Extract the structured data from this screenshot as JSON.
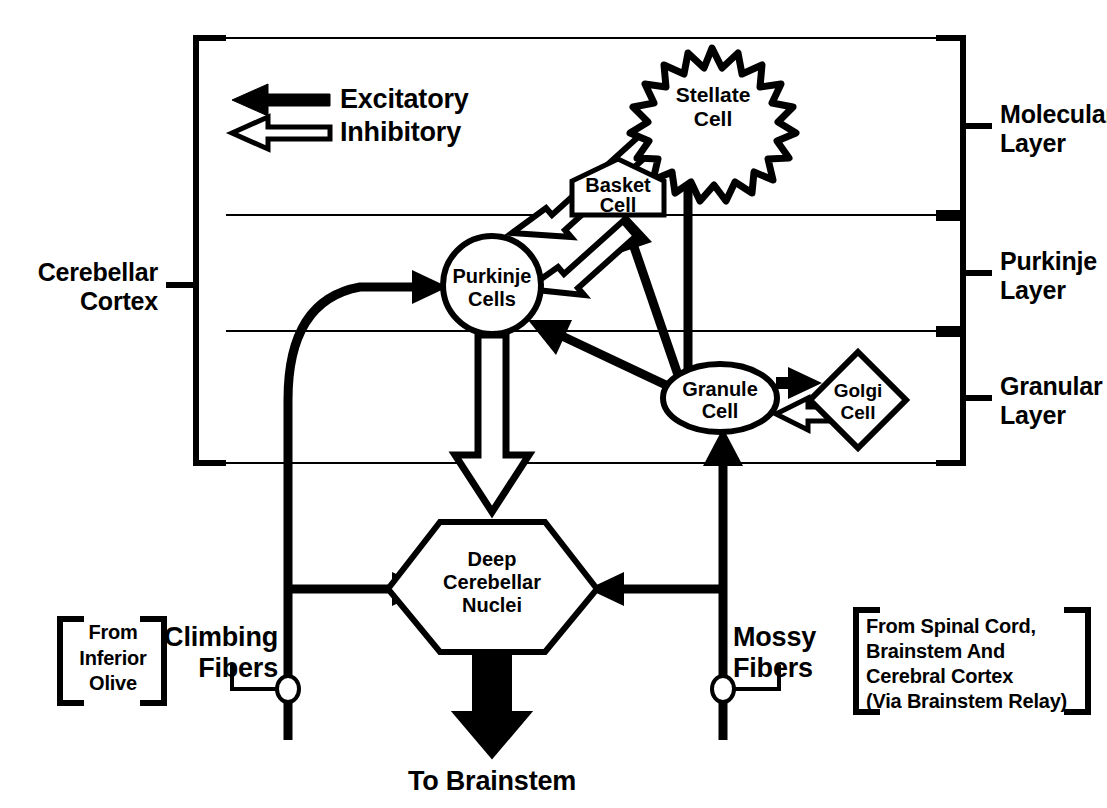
{
  "diagram": {
    "legend": {
      "excitatory_label": "Excitatory",
      "inhibitory_label": "Inhibitory"
    },
    "brackets": {
      "cerebellar_cortex": "Cerebellar\nCortex",
      "molecular_layer": "Molecular\nLayer",
      "purkinje_layer": "Purkinje\nLayer",
      "granular_layer": "Granular\nLayer"
    },
    "nodes": {
      "stellate": {
        "line1": "Stellate",
        "line2": "Cell",
        "shape": "starburst"
      },
      "basket": {
        "line1": "Basket",
        "line2": "Cell",
        "shape": "pentagon"
      },
      "purkinje": {
        "line1": "Purkinje",
        "line2": "Cells",
        "shape": "circle"
      },
      "granule": {
        "line1": "Granule",
        "line2": "Cell",
        "shape": "ellipse"
      },
      "golgi": {
        "line1": "Golgi",
        "line2": "Cell",
        "shape": "diamond"
      },
      "deep_nuclei": {
        "line1": "Deep",
        "line2": "Cerebellar",
        "line3": "Nuclei",
        "shape": "hexagon"
      }
    },
    "inputs": {
      "climbing_fibers_label": "Climbing\nFibers",
      "climbing_source": "From\nInferior\nOlive",
      "mossy_fibers_label": "Mossy\nFibers",
      "mossy_source_lines": [
        "From Spinal Cord,",
        "Brainstem And",
        "Cerebral Cortex",
        "(Via Brainstem Relay)"
      ]
    },
    "output": {
      "to_brainstem_label": "To Brainstem"
    },
    "colors": {
      "ink": "#000000",
      "background": "#ffffff"
    },
    "connections": [
      {
        "from": "stellate",
        "to": "purkinje",
        "type": "inhibitory"
      },
      {
        "from": "basket",
        "to": "purkinje",
        "type": "inhibitory"
      },
      {
        "from": "purkinje",
        "to": "deep_nuclei",
        "type": "inhibitory"
      },
      {
        "from": "golgi",
        "to": "granule",
        "type": "inhibitory"
      },
      {
        "from": "granule",
        "to": "golgi",
        "type": "excitatory"
      },
      {
        "from": "granule",
        "to": "purkinje",
        "type": "excitatory"
      },
      {
        "from": "granule",
        "to": "basket",
        "type": "excitatory"
      },
      {
        "from": "granule",
        "to": "stellate",
        "type": "excitatory"
      },
      {
        "from": "climbing_fibers",
        "to": "purkinje",
        "type": "excitatory"
      },
      {
        "from": "climbing_fibers",
        "to": "deep_nuclei",
        "type": "excitatory"
      },
      {
        "from": "mossy_fibers",
        "to": "granule",
        "type": "excitatory"
      },
      {
        "from": "mossy_fibers",
        "to": "deep_nuclei",
        "type": "excitatory"
      },
      {
        "from": "deep_nuclei",
        "to": "brainstem",
        "type": "excitatory"
      }
    ]
  }
}
